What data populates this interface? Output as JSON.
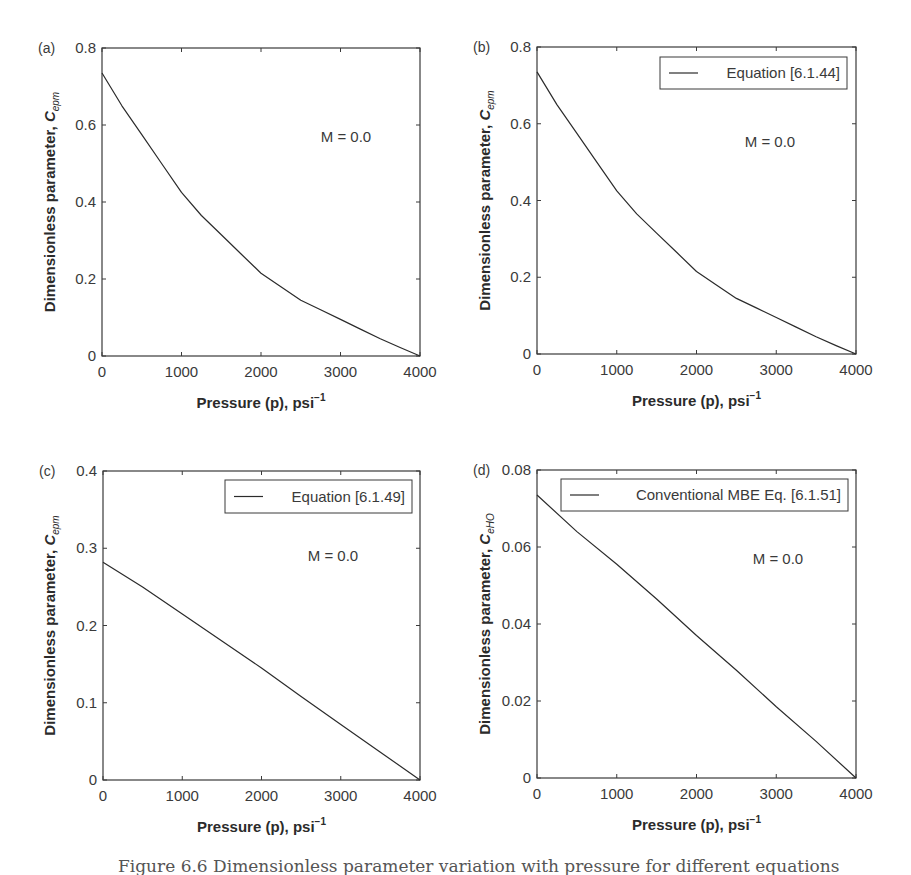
{
  "figure": {
    "caption": "Figure 6.6 Dimensionless parameter variation with pressure for different equations"
  },
  "chart_data": [
    {
      "type": "line",
      "panel": "(a)",
      "title": "",
      "xlabel": "Pressure (p), psi⁻¹",
      "ylabel": "Dimensionless parameter, C_epm",
      "ylabel_main": "Dimensionless parameter, ",
      "ylabel_symbol": "C",
      "ylabel_sub": "epm",
      "xlim": [
        0,
        4000
      ],
      "ylim": [
        0,
        0.8
      ],
      "xticks": [
        "0",
        "1000",
        "2000",
        "3000",
        "4000"
      ],
      "yticks": [
        "0",
        "0.2",
        "0.4",
        "0.6",
        "0.8"
      ],
      "annotation": "M = 0.0",
      "legend": null,
      "grid": false,
      "series": [
        {
          "name": "C_epm",
          "x": [
            0,
            250,
            500,
            750,
            1000,
            1250,
            1500,
            1750,
            2000,
            2250,
            2500,
            2750,
            3000,
            3250,
            3500,
            3750,
            4000
          ],
          "y": [
            0.735,
            0.65,
            0.575,
            0.5,
            0.425,
            0.365,
            0.315,
            0.265,
            0.215,
            0.18,
            0.145,
            0.12,
            0.095,
            0.07,
            0.045,
            0.022,
            0.0
          ]
        }
      ]
    },
    {
      "type": "line",
      "panel": "(b)",
      "title": "",
      "xlabel": "Pressure (p), psi⁻¹",
      "ylabel": "Dimensionless parameter, C_epm",
      "ylabel_main": "Dimensionless parameter, ",
      "ylabel_symbol": "C",
      "ylabel_sub": "epm",
      "xlim": [
        0,
        4000
      ],
      "ylim": [
        0,
        0.8
      ],
      "xticks": [
        "0",
        "1000",
        "2000",
        "3000",
        "4000"
      ],
      "yticks": [
        "0",
        "0.2",
        "0.4",
        "0.6",
        "0.8"
      ],
      "annotation": "M = 0.0",
      "legend": {
        "position": "upper right",
        "entries": [
          "Equation [6.1.44]"
        ]
      },
      "grid": false,
      "series": [
        {
          "name": "Equation [6.1.44]",
          "x": [
            0,
            250,
            500,
            750,
            1000,
            1250,
            1500,
            1750,
            2000,
            2250,
            2500,
            2750,
            3000,
            3250,
            3500,
            3750,
            4000
          ],
          "y": [
            0.735,
            0.65,
            0.575,
            0.5,
            0.425,
            0.365,
            0.315,
            0.265,
            0.215,
            0.18,
            0.145,
            0.12,
            0.095,
            0.07,
            0.045,
            0.022,
            0.0
          ]
        }
      ]
    },
    {
      "type": "line",
      "panel": "(c)",
      "title": "",
      "xlabel": "Pressure (p), psi⁻¹",
      "ylabel": "Dimensionless parameter, C_epm",
      "ylabel_main": "Dimensionless parameter, ",
      "ylabel_symbol": "C",
      "ylabel_sub": "epm",
      "xlim": [
        0,
        4000
      ],
      "ylim": [
        0,
        0.4
      ],
      "xticks": [
        "0",
        "1000",
        "2000",
        "3000",
        "4000"
      ],
      "yticks": [
        "0",
        "0.1",
        "0.2",
        "0.3",
        "0.4"
      ],
      "annotation": "M = 0.0",
      "legend": {
        "position": "upper right",
        "entries": [
          "Equation [6.1.49]"
        ]
      },
      "grid": false,
      "series": [
        {
          "name": "Equation [6.1.49]",
          "x": [
            0,
            500,
            1000,
            1500,
            2000,
            2500,
            3000,
            3500,
            4000
          ],
          "y": [
            0.282,
            0.25,
            0.215,
            0.18,
            0.145,
            0.108,
            0.072,
            0.036,
            0.0
          ]
        }
      ]
    },
    {
      "type": "line",
      "panel": "(d)",
      "title": "",
      "xlabel": "Pressure (p), psi⁻¹",
      "ylabel": "Dimensionless parameter, C_eHO",
      "ylabel_main": "Dimensionless parameter, ",
      "ylabel_symbol": "C",
      "ylabel_sub": "eHO",
      "xlim": [
        0,
        4000
      ],
      "ylim": [
        0,
        0.08
      ],
      "xticks": [
        "0",
        "1000",
        "2000",
        "3000",
        "4000"
      ],
      "yticks": [
        "0",
        "0.02",
        "0.04",
        "0.06",
        "0.08"
      ],
      "annotation": "M = 0.0",
      "legend": {
        "position": "upper right",
        "entries": [
          "Conventional MBE Eq. [6.1.51]"
        ]
      },
      "grid": false,
      "series": [
        {
          "name": "Conventional MBE Eq. [6.1.51]",
          "x": [
            0,
            500,
            1000,
            1500,
            2000,
            2500,
            3000,
            3500,
            4000
          ],
          "y": [
            0.0735,
            0.064,
            0.0555,
            0.0465,
            0.037,
            0.028,
            0.0185,
            0.0095,
            0.0
          ]
        }
      ]
    }
  ],
  "colors": {
    "line": "#2b2b2b",
    "frame": "#3a3a3a",
    "background": "#ffffff"
  }
}
